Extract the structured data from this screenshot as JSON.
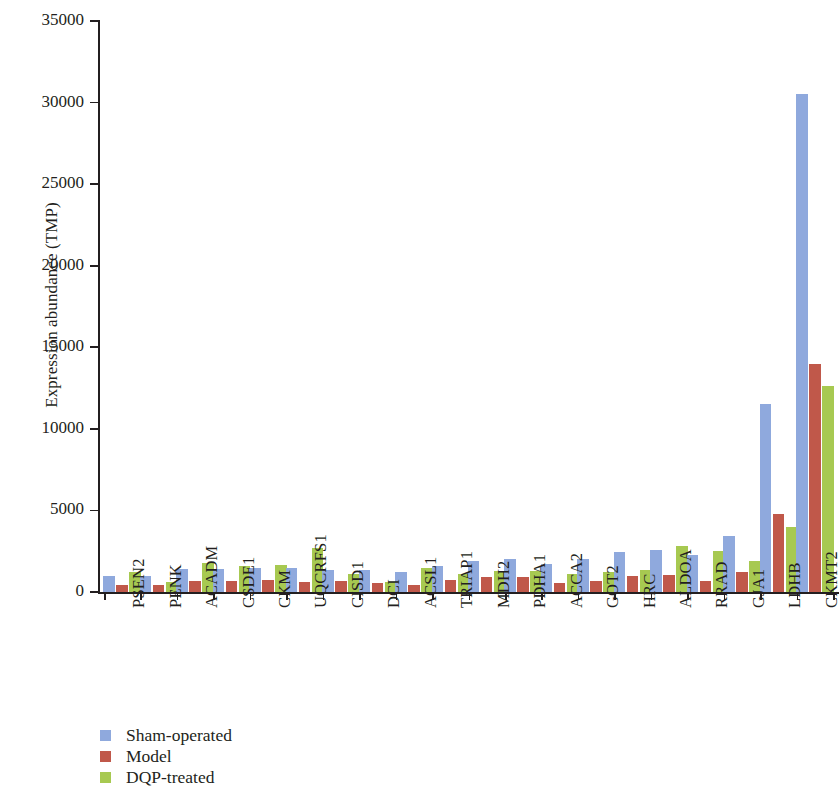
{
  "chart_data": {
    "type": "bar",
    "title": "",
    "xlabel": "",
    "ylabel": "Expression abundance (TMP)",
    "ylim": [
      0,
      35000
    ],
    "ytick_step": 5000,
    "yticks": [
      "35000",
      "30000",
      "25000",
      "20000",
      "15000",
      "10000",
      "5000",
      "0"
    ],
    "grid": false,
    "legend_position": "bottom-left",
    "orientation": "vertical",
    "grouping": "clustered",
    "categories": [
      "PSEN2",
      "PENK",
      "ACADM",
      "CSDE1",
      "CKM",
      "UQCRFS1",
      "CISD1",
      "DCI",
      "ACSL1",
      "TRIAP1",
      "MDH2",
      "PDHA1",
      "ACCA2",
      "GOT2",
      "HRC",
      "ALDOA",
      "RRAD",
      "GJA1",
      "LDHB",
      "CKMT2"
    ],
    "series": [
      {
        "name": "Sham-operated",
        "color": "#8fa9dd",
        "values": [
          1000,
          1000,
          1400,
          1400,
          1500,
          1450,
          1350,
          1350,
          1200,
          1600,
          1900,
          2000,
          1700,
          2000,
          2450,
          2550,
          2250,
          3450,
          11500,
          30500
        ]
      },
      {
        "name": "Model",
        "color": "#c0584a",
        "values": [
          400,
          450,
          700,
          700,
          750,
          600,
          650,
          550,
          450,
          750,
          950,
          950,
          550,
          700,
          1000,
          1050,
          700,
          1250,
          4800,
          14000
        ]
      },
      {
        "name": "DQP-treated",
        "color": "#a7c951",
        "values": [
          1200,
          600,
          1800,
          1600,
          1650,
          2700,
          1100,
          600,
          1500,
          1100,
          1300,
          1300,
          1100,
          1200,
          1350,
          2800,
          2500,
          1900,
          4000,
          12600
        ]
      }
    ]
  },
  "legend": {
    "items": [
      {
        "label": "Sham-operated",
        "color": "#8fa9dd"
      },
      {
        "label": "Model",
        "color": "#c0584a"
      },
      {
        "label": "DQP-treated",
        "color": "#a7c951"
      }
    ]
  }
}
